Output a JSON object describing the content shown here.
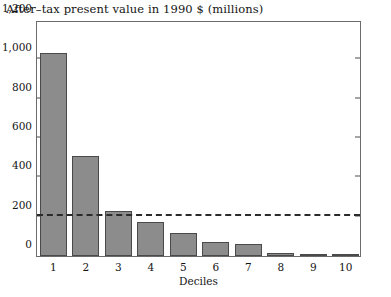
{
  "chart_data": {
    "type": "bar",
    "title": "After–tax present value in 1990 $ (millions)",
    "xlabel": "Deciles",
    "ylabel": "",
    "categories": [
      "1",
      "2",
      "3",
      "4",
      "5",
      "6",
      "7",
      "8",
      "9",
      "10"
    ],
    "values": [
      1030,
      510,
      230,
      175,
      115,
      72,
      60,
      15,
      10,
      8
    ],
    "ylim": [
      0,
      1200
    ],
    "yticks": [
      0,
      200,
      400,
      600,
      800,
      1000,
      1200
    ],
    "ytick_labels": [
      "0",
      "200",
      "400",
      "600",
      "800",
      "1,000",
      "1,200"
    ],
    "grid": false,
    "legend": "none",
    "bar_color": "#8c8c8c",
    "bar_edge_color": "#4a4a4a",
    "annotations": [
      {
        "name": "reference-line",
        "type": "horizontal-dashed-line",
        "value": 200,
        "color": "#2b2b2b"
      }
    ]
  }
}
